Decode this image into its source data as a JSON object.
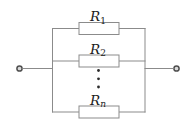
{
  "diagram": {
    "kind": "circuit-schematic",
    "resistors": [
      {
        "symbol": "R",
        "subscript": "1"
      },
      {
        "symbol": "R",
        "subscript": "2"
      },
      {
        "symbol": "R",
        "subscript": "n"
      }
    ],
    "ellipsis_dot_count": 3
  },
  "theme": {
    "background": "#ffffff",
    "wire": "#8b8b8b",
    "component-stroke": "#8b8b8b",
    "component-fill": "#ffffff",
    "terminal-stroke": "#4f4f4f",
    "terminal-fill": "#d9d9d9",
    "text": "#1c1c1c",
    "dot": "#2b2b2b"
  }
}
